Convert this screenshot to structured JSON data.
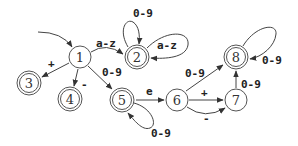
{
  "diagram": {
    "type": "finite-state-automaton",
    "nodes": [
      {
        "id": "1",
        "label": "1",
        "x": 80,
        "y": 57,
        "accepting": false,
        "start": true
      },
      {
        "id": "2",
        "label": "2",
        "x": 137,
        "y": 57,
        "accepting": true
      },
      {
        "id": "3",
        "label": "3",
        "x": 29,
        "y": 83,
        "accepting": true
      },
      {
        "id": "4",
        "label": "4",
        "x": 70,
        "y": 99,
        "accepting": true
      },
      {
        "id": "5",
        "label": "5",
        "x": 122,
        "y": 100,
        "accepting": true
      },
      {
        "id": "6",
        "label": "6",
        "x": 177,
        "y": 100,
        "accepting": false
      },
      {
        "id": "7",
        "label": "7",
        "x": 236,
        "y": 100,
        "accepting": false
      },
      {
        "id": "8",
        "label": "8",
        "x": 236,
        "y": 57,
        "accepting": true
      }
    ],
    "edges": [
      {
        "from": "start",
        "to": "1",
        "label": ""
      },
      {
        "from": "1",
        "to": "2",
        "label": "a-z"
      },
      {
        "from": "1",
        "to": "3",
        "label": "+"
      },
      {
        "from": "1",
        "to": "4",
        "label": "-"
      },
      {
        "from": "1",
        "to": "5",
        "label": "0-9"
      },
      {
        "from": "2",
        "to": "2",
        "label": "0-9"
      },
      {
        "from": "2",
        "to": "2",
        "label": "a-z"
      },
      {
        "from": "5",
        "to": "5",
        "label": "0-9"
      },
      {
        "from": "5",
        "to": "6",
        "label": "e"
      },
      {
        "from": "6",
        "to": "8",
        "label": "0-9"
      },
      {
        "from": "6",
        "to": "7",
        "label": "+"
      },
      {
        "from": "6",
        "to": "7",
        "label": "-"
      },
      {
        "from": "7",
        "to": "8",
        "label": "0-9"
      },
      {
        "from": "8",
        "to": "8",
        "label": "0-9"
      }
    ]
  }
}
